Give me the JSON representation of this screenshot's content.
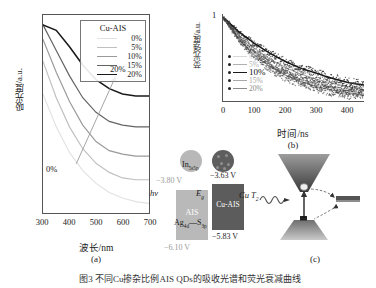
{
  "figure": {
    "caption": "图3  不同Cu掺杂比例AIS QDs的吸收光谱和荧光衰减曲线"
  },
  "panel_a": {
    "tag": "(a)",
    "xlabel": "波长/nm",
    "ylabel": "吸光度/a.u.",
    "xticks": [
      "300",
      "400",
      "500",
      "600",
      "700"
    ],
    "legend_title": "Cu-AIS",
    "legend": [
      {
        "label": "0%",
        "color": "#e2e2e2"
      },
      {
        "label": "5%",
        "color": "#c0c0c0"
      },
      {
        "label": "10%",
        "color": "#9a9a9a"
      },
      {
        "label": "15%",
        "color": "#636363"
      },
      {
        "label": "20%",
        "color": "#1a1a1a"
      }
    ],
    "annotation_top": "20%",
    "annotation_bottom": "0%"
  },
  "panel_b": {
    "tag": "(b)",
    "xlabel": "时间/ns",
    "ylabel": "荧光强度/a.u.",
    "ymax_label": "1",
    "ymin_label": "0",
    "xticks": [
      "0",
      "100",
      "200",
      "300",
      "400"
    ],
    "legend": [
      {
        "label": "0%",
        "color": "#d8d8d8"
      },
      {
        "label": "5%",
        "color": "#b0b0b0"
      },
      {
        "label": "10%",
        "color": "#1a1a1a"
      },
      {
        "label": "15%",
        "color": "#a8a8a8"
      },
      {
        "label": "20%",
        "color": "#8a8a8a"
      }
    ]
  },
  "panel_c": {
    "tag": "(c)",
    "sample_left_label": "AIS",
    "sample_right_label": "Cu-AIS",
    "ais_lumo": "−3.80 V",
    "cuais_lumo": "−3.63 V",
    "cuais_homo": "−5.83 V",
    "ais_homo": "−6.10 V",
    "band_cb_label": "In",
    "band_cb_sub": "5s5p",
    "band_vb_label_1": "Ag",
    "band_vb_sub_1": "4d",
    "band_vb_label_2": "S",
    "band_vb_sub_2": "3p",
    "band_trap_label": "Cu",
    "band_trap_sub": "T",
    "band_trap_sub2": "2",
    "band_gap_label": "E",
    "band_gap_sub": "g",
    "band_excite_label": "hν"
  },
  "colors": {
    "axis": "#555555",
    "text": "#1a1a1a",
    "muted": "#9a9a9a",
    "block_ais": "#b9b9b9",
    "block_cuais": "#5c5c5c"
  },
  "chart_data": [
    {
      "type": "line",
      "id": "panel_a_absorption",
      "title": "",
      "xlabel": "波长/nm",
      "ylabel": "吸光度/a.u.",
      "xlim": [
        300,
        700
      ],
      "ylim": [
        0,
        1
      ],
      "grid": false,
      "legend_position": "top-right",
      "legend_title": "Cu-AIS",
      "x": [
        300,
        350,
        400,
        450,
        500,
        550,
        600,
        650,
        700
      ],
      "series": [
        {
          "name": "0%",
          "color": "#e2e2e2",
          "values": [
            0.62,
            0.44,
            0.3,
            0.2,
            0.13,
            0.08,
            0.05,
            0.03,
            0.02
          ]
        },
        {
          "name": "5%",
          "color": "#c0c0c0",
          "values": [
            0.8,
            0.6,
            0.44,
            0.32,
            0.24,
            0.19,
            0.16,
            0.15,
            0.15
          ]
        },
        {
          "name": "10%",
          "color": "#9a9a9a",
          "values": [
            0.92,
            0.74,
            0.58,
            0.45,
            0.36,
            0.31,
            0.29,
            0.28,
            0.28
          ]
        },
        {
          "name": "15%",
          "color": "#636363",
          "values": [
            1.0,
            0.86,
            0.72,
            0.6,
            0.52,
            0.47,
            0.45,
            0.44,
            0.44
          ]
        },
        {
          "name": "20%",
          "color": "#1a1a1a",
          "values": [
            1.0,
            0.97,
            0.88,
            0.78,
            0.7,
            0.65,
            0.62,
            0.61,
            0.61
          ]
        }
      ]
    },
    {
      "type": "scatter",
      "id": "panel_b_pl_decay",
      "title": "",
      "xlabel": "时间/ns",
      "ylabel": "荧光强度/a.u.",
      "xlim": [
        0,
        450
      ],
      "ylim": [
        0,
        1
      ],
      "grid": false,
      "legend_position": "left",
      "x": [
        0,
        50,
        100,
        150,
        200,
        250,
        300,
        350,
        400,
        450
      ],
      "series": [
        {
          "name": "0%",
          "color": "#d8d8d8",
          "values": [
            1.0,
            0.72,
            0.52,
            0.38,
            0.28,
            0.2,
            0.15,
            0.11,
            0.08,
            0.06
          ]
        },
        {
          "name": "5%",
          "color": "#b0b0b0",
          "values": [
            1.0,
            0.76,
            0.58,
            0.44,
            0.34,
            0.26,
            0.2,
            0.15,
            0.12,
            0.09
          ]
        },
        {
          "name": "10%",
          "color": "#1a1a1a",
          "values": [
            1.0,
            0.83,
            0.69,
            0.57,
            0.47,
            0.39,
            0.33,
            0.27,
            0.22,
            0.19
          ]
        },
        {
          "name": "15%",
          "color": "#a8a8a8",
          "values": [
            1.0,
            0.79,
            0.63,
            0.5,
            0.4,
            0.32,
            0.26,
            0.21,
            0.17,
            0.13
          ]
        },
        {
          "name": "20%",
          "color": "#8a8a8a",
          "values": [
            1.0,
            0.74,
            0.55,
            0.41,
            0.31,
            0.23,
            0.17,
            0.13,
            0.1,
            0.07
          ]
        }
      ]
    },
    {
      "type": "table",
      "id": "panel_c_energy_levels",
      "title": "能级图",
      "columns": [
        "样品",
        "LUMO/V",
        "HOMO/V"
      ],
      "rows": [
        [
          "AIS",
          "−3.80",
          "−6.10"
        ],
        [
          "Cu-AIS",
          "−3.63",
          "−5.83"
        ]
      ]
    }
  ]
}
